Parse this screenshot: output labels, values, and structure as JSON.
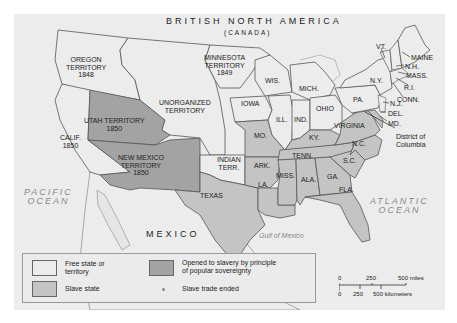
{
  "map": {
    "title": "BRITISH NORTH AMERICA",
    "subtitle": "(CANADA)",
    "colors": {
      "free": "#ececec",
      "slave": "#c4c4c4",
      "popular_sovereignty": "#a3a3a3",
      "water": "#ececec",
      "border": "#555555"
    },
    "regions": {
      "oregon": [
        "OREGON",
        "TERRITORY",
        "1848"
      ],
      "minnesota": [
        "MINNESOTA",
        "TERRITORY",
        "1849"
      ],
      "unorganized": [
        "UNORGANIZED",
        "TERRITORY"
      ],
      "utah": [
        "UTAH TERRITORY",
        "1850"
      ],
      "calif": [
        "CALIF.",
        "1850"
      ],
      "new_mexico": [
        "NEW MEXICO",
        "TERRITORY",
        "1850"
      ],
      "indian": [
        "INDIAN",
        "TERR."
      ],
      "texas": "TEXAS",
      "wis": "WIS.",
      "iowa": "IOWA",
      "mich": "MICH.",
      "ill": "ILL.",
      "ind": "IND.",
      "ohio": "OHIO",
      "mo": "MO.",
      "ky": "KY.",
      "ark": "ARK.",
      "tenn": "TENN.",
      "la": "LA.",
      "miss": "MISS.",
      "ala": "ALA.",
      "ga": "GA.",
      "sc": "S.C.",
      "nc": "N.C.",
      "fla": "FLA.",
      "virginia": "VIRGINIA",
      "pa": "PA.",
      "ny": "N.Y.",
      "vt": "VT.",
      "maine": "MAINE",
      "nh": "N.H.",
      "mass": "MASS.",
      "ri": "R.I.",
      "conn": "CONN.",
      "nj": "N.J.",
      "del": "DEL.",
      "md": "MD.",
      "dc": [
        "District of",
        "Columbia"
      ]
    },
    "water_labels": {
      "pacific": [
        "PACIFIC",
        "OCEAN"
      ],
      "atlantic": [
        "ATLANTIC",
        "OCEAN"
      ],
      "gulf": "Gulf of Mexico"
    },
    "mexico": "MEXICO"
  },
  "legend": {
    "items": [
      {
        "label": "Free state or territory",
        "lines": [
          "Free state or",
          "territory"
        ],
        "swatch": "free"
      },
      {
        "label": "Slave state",
        "lines": [
          "Slave state"
        ],
        "swatch": "slave"
      },
      {
        "label": "Opened to slavery by principle of popular sovereignty",
        "lines": [
          "Opened to slavery by principle",
          "of popular sovereignty"
        ],
        "swatch": "popular_sovereignty"
      },
      {
        "label": "Slave trade ended",
        "lines": [
          "Slave trade ended"
        ],
        "swatch": "dot"
      }
    ]
  },
  "scale": {
    "miles": [
      "0",
      "250",
      "500 miles"
    ],
    "kilometers": [
      "0",
      "250",
      "500 kilometers"
    ]
  }
}
